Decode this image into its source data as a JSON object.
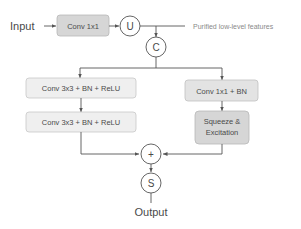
{
  "diagram": {
    "input_label": "Input",
    "output_label": "Output",
    "side_label": "Purified low-level features",
    "blocks": {
      "conv1x1": "Conv 1x1",
      "left_conv_1": "Conv 3x3 + BN + ReLU",
      "left_conv_2": "Conv 3x3 + BN + ReLU",
      "right_conv": "Conv 1x1 + BN",
      "se_line1": "Squeeze &",
      "se_line2": "Excitation"
    },
    "nodes": {
      "upsample": "U",
      "concat": "C",
      "add": "+",
      "sigmoid": "S"
    },
    "colors": {
      "line": "#555555",
      "box_light": "#efefef",
      "box_mid": "#e3e3e3",
      "box_dark": "#d6d6d6",
      "text": "#4a4a4a"
    }
  }
}
